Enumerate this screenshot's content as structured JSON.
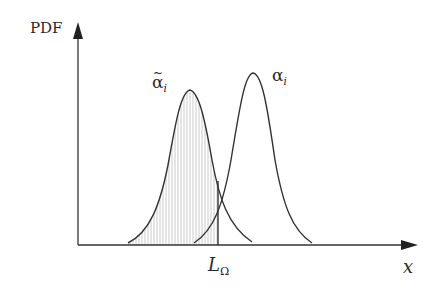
{
  "diagram": {
    "type": "probability-density-overlap",
    "y_axis_label": "PDF",
    "x_axis_label": "x",
    "threshold_label": {
      "main": "L",
      "sub": "Ω"
    },
    "curves": [
      {
        "id": "alpha-tilde",
        "label_symbol": "α",
        "label_accent": "~",
        "label_sub": "i",
        "peak": [
          190,
          90
        ],
        "support": [
          128,
          252
        ],
        "shaded_until_threshold": true
      },
      {
        "id": "alpha",
        "label_symbol": "α",
        "label_accent": "",
        "label_sub": "i",
        "peak": [
          253,
          73
        ],
        "support": [
          194,
          312
        ],
        "shaded_until_threshold": false
      }
    ],
    "threshold_x": 218,
    "colors": {
      "stroke": "#333333",
      "hatch": "#b8b8b8",
      "background": "#ffffff"
    }
  }
}
